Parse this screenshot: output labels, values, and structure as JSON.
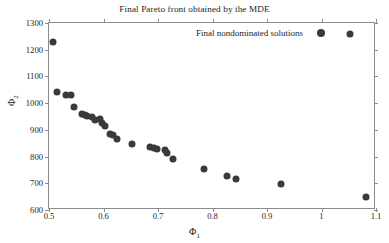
{
  "chart_data": {
    "type": "scatter",
    "title": "Final Pareto front obtained by the MDE",
    "xlabel": "Φ₁",
    "ylabel": "Φ₂",
    "xlabel_base": "Φ",
    "xlabel_sub": "1",
    "ylabel_base": "Φ",
    "ylabel_sub": "2",
    "xlim": [
      0.5,
      1.1
    ],
    "ylim": [
      600,
      1300
    ],
    "xticks": [
      0.5,
      0.6,
      0.7,
      0.8,
      0.9,
      1.0,
      1.1
    ],
    "xticklabels": [
      "0.5",
      "0.6",
      "0.7",
      "0.8",
      "0.9",
      "1",
      "1.1"
    ],
    "yticks": [
      600,
      700,
      800,
      900,
      1000,
      1100,
      1200,
      1300
    ],
    "yticklabels": [
      "600",
      "700",
      "800",
      "900",
      "1000",
      "1100",
      "1200",
      "1300"
    ],
    "grid": false,
    "legend": {
      "position": "top-right-inside",
      "entries": [
        {
          "label": "Final nondominated solutions",
          "marker": "filled-circle",
          "color": "#3a3a3a"
        }
      ]
    },
    "series": [
      {
        "name": "Final nondominated solutions",
        "marker": "filled-circle",
        "color": "#3a3a3a",
        "points": [
          [
            0.507,
            1229
          ],
          [
            0.515,
            1042
          ],
          [
            0.531,
            1032
          ],
          [
            0.54,
            1030
          ],
          [
            0.546,
            985
          ],
          [
            0.561,
            960
          ],
          [
            0.566,
            955
          ],
          [
            0.57,
            952
          ],
          [
            0.578,
            949
          ],
          [
            0.585,
            938
          ],
          [
            0.594,
            942
          ],
          [
            0.597,
            925
          ],
          [
            0.603,
            915
          ],
          [
            0.612,
            886
          ],
          [
            0.617,
            881
          ],
          [
            0.625,
            866
          ],
          [
            0.653,
            848
          ],
          [
            0.686,
            835
          ],
          [
            0.693,
            831
          ],
          [
            0.699,
            828
          ],
          [
            0.712,
            824
          ],
          [
            0.716,
            812
          ],
          [
            0.727,
            791
          ],
          [
            0.784,
            752
          ],
          [
            0.826,
            729
          ],
          [
            0.843,
            716
          ],
          [
            0.926,
            699
          ],
          [
            1.053,
            1259
          ],
          [
            1.082,
            650
          ]
        ]
      }
    ]
  }
}
